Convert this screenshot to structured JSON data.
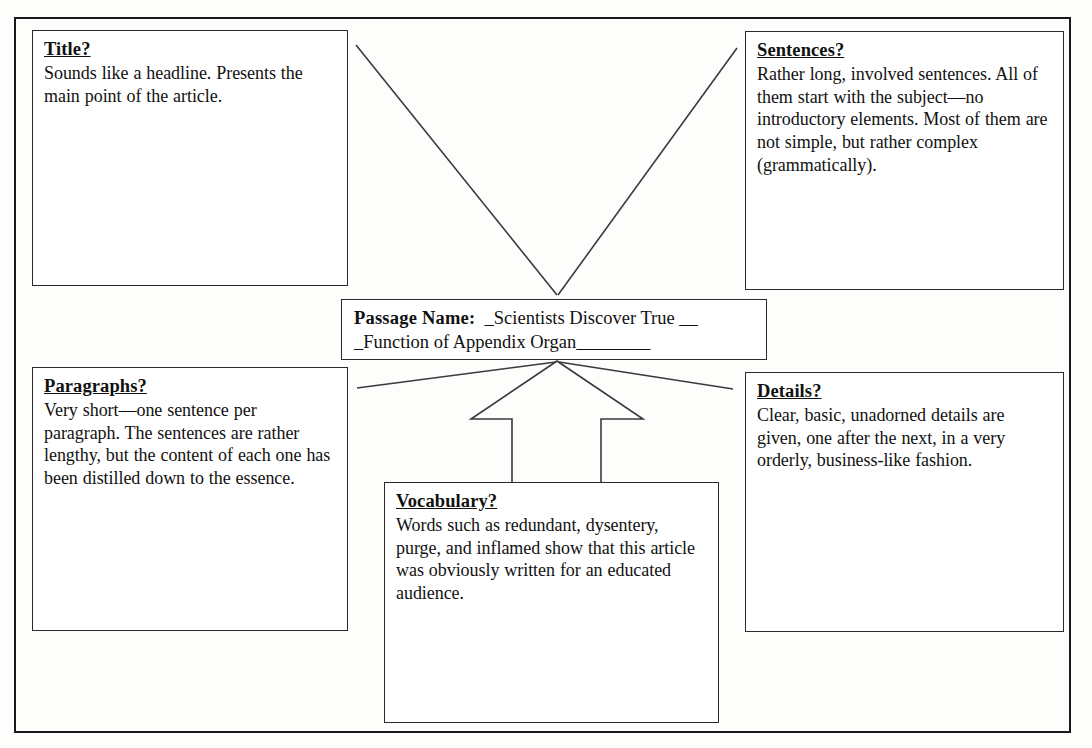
{
  "document": {
    "type": "graphic-organizer-worksheet",
    "line_color": "#2a2a2a",
    "page_background": "#fdfdfc"
  },
  "center": {
    "label": "Passage Name:",
    "value_line_1": "  _Scientists Discover True __",
    "value_line_2": "_Function of Appendix Organ________"
  },
  "boxes": [
    {
      "id": "title",
      "heading": "Title?",
      "body": "Sounds like a headline.  Presents the main point of the article."
    },
    {
      "id": "sentences",
      "heading": "Sentences?",
      "body": "Rather long, involved sentences.  All of them start with the subject—no introductory elements.  Most of them are not simple, but rather complex (grammatically)."
    },
    {
      "id": "paragraphs",
      "heading": "Paragraphs?",
      "body": "Very short—one sentence per paragraph.  The sentences are rather lengthy, but the content of each one has been distilled down to the essence."
    },
    {
      "id": "details",
      "heading": "Details?",
      "body": "Clear, basic, unadorned details are given, one after the next, in a very orderly, business-like fashion."
    },
    {
      "id": "vocabulary",
      "heading": "Vocabulary?",
      "body": "Words such as redundant, dysentery, purge, and inflamed show that this article was obviously written for an educated audience."
    }
  ],
  "connectors": {
    "title_line": "diagonal-line-title-to-center",
    "sentences_line": "diagonal-line-sentences-to-center",
    "paragraphs_line": "diagonal-line-paragraphs-to-center",
    "details_line": "diagonal-line-details-to-center",
    "vocabulary_arrow": "block-arrow-vocabulary-to-center"
  }
}
